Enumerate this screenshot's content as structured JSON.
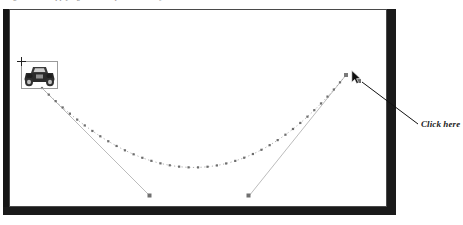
{
  "figure": {
    "caption_remnant": "Figure 9-14.  Applying a motion path to an object",
    "background_color": "#ffffff"
  },
  "stage": {
    "name": "slide-stage",
    "border_color": "#4a4a4a",
    "shadow_color": "#1a1a1a",
    "fill_color": "#ffffff",
    "bounds": {
      "x": 9,
      "y": 9,
      "width": 378,
      "height": 198
    }
  },
  "sprite": {
    "name": "car-object",
    "label": "car",
    "selected": true,
    "selection_border_color": "#9a9a9a",
    "body_color": "#2b2b2b",
    "bounds": {
      "x": 21,
      "y": 61,
      "width": 37,
      "height": 28
    }
  },
  "motion_path": {
    "name": "motion-path-curve",
    "type": "bezier-curve",
    "dot_color": "#8c8c8c",
    "dot_marker_color": "#6e6e6e",
    "start_point": {
      "x": 42,
      "y": 88
    },
    "end_point": {
      "x": 346,
      "y": 75
    },
    "control_point_1": {
      "x": 150,
      "y": 196
    },
    "control_point_2": {
      "x": 249,
      "y": 196
    },
    "dot_count": 38
  },
  "control_handles": [
    {
      "name": "control-handle-left",
      "from": {
        "x": 42,
        "y": 88
      },
      "to": {
        "x": 150,
        "y": 196
      },
      "line_color": "#b4b4b4",
      "marker_color": "#707070"
    },
    {
      "name": "control-handle-right",
      "from": {
        "x": 346,
        "y": 75
      },
      "to": {
        "x": 249,
        "y": 196
      },
      "line_color": "#b4b4b4",
      "marker_color": "#707070"
    }
  ],
  "end_marker": {
    "name": "path-end-marker",
    "position": {
      "x": 359,
      "y": 81
    },
    "color": "#6e6e6e"
  },
  "cursor": {
    "name": "mouse-pointer",
    "position": {
      "x": 351,
      "y": 70
    },
    "color": "#1a1a1a"
  },
  "annotation": {
    "name": "click-here-callout",
    "text": "Click here",
    "text_color": "#1b1b1b",
    "leader_line": {
      "from": {
        "x": 362,
        "y": 82
      },
      "to": {
        "x": 418,
        "y": 124
      },
      "color": "#111111"
    }
  }
}
